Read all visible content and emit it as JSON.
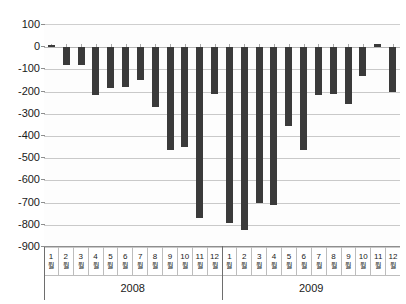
{
  "chart_data": {
    "type": "bar",
    "title": "",
    "subtitle": "",
    "xlabel": "",
    "ylabel": "",
    "ylim": [
      -900,
      100
    ],
    "ytick_step": 100,
    "yticks": [
      100,
      0,
      -100,
      -200,
      -300,
      -400,
      -500,
      -600,
      -700,
      -800,
      -900
    ],
    "ytick_labels": [
      "100",
      "0",
      "-100",
      "-200",
      "-300",
      "-400",
      "-500",
      "-600",
      "-700",
      "-800",
      "-900"
    ],
    "grid": true,
    "grid_axis": "y",
    "legend": null,
    "legend_position": "none",
    "bar_color": "#3a3a3a",
    "groups": [
      {
        "label": "2008",
        "categories": [
          "1월",
          "2월",
          "3월",
          "4월",
          "5월",
          "6월",
          "7월",
          "8월",
          "9월",
          "10월",
          "11월",
          "12월"
        ],
        "values": [
          10,
          -80,
          -78,
          -215,
          -185,
          -180,
          -150,
          -270,
          -465,
          -450,
          -770,
          -210
        ]
      },
      {
        "label": "2009",
        "categories": [
          "1월",
          "2월",
          "3월",
          "4월",
          "5월",
          "6월",
          "7월",
          "8월",
          "9월",
          "10월",
          "11월",
          "12월"
        ],
        "values": [
          -790,
          -825,
          -700,
          -710,
          -355,
          -465,
          -215,
          -210,
          -255,
          -130,
          15,
          -200
        ]
      }
    ]
  }
}
